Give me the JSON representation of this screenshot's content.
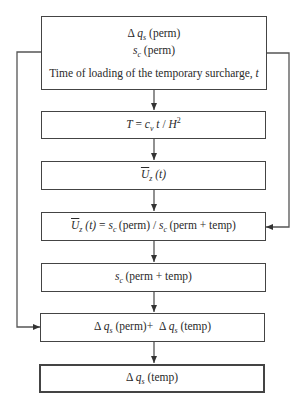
{
  "diagram": {
    "type": "flowchart",
    "nodes": [
      {
        "id": "input",
        "lines": [
          "Δ q_s (perm)",
          "s_c (perm)",
          "Time of loading of the temporary surcharge, t"
        ]
      },
      {
        "id": "time-factor",
        "lines": [
          "T = c_v t / H^2"
        ]
      },
      {
        "id": "avg-consolidation",
        "lines": [
          "U_z (t)"
        ]
      },
      {
        "id": "consolidation-ratio",
        "lines": [
          "U_z (t) = s_c(perm) / s_c(perm + temp)"
        ]
      },
      {
        "id": "total-settlement",
        "lines": [
          "s_c(perm + temp)"
        ]
      },
      {
        "id": "total-surcharge",
        "lines": [
          "Δ q_s (perm)+ Δ q_s (temp)"
        ]
      },
      {
        "id": "temp-surcharge",
        "lines": [
          "Δ q_s (temp)"
        ]
      }
    ],
    "edges": [
      {
        "from": "input",
        "to": "time-factor"
      },
      {
        "from": "time-factor",
        "to": "avg-consolidation"
      },
      {
        "from": "avg-consolidation",
        "to": "consolidation-ratio"
      },
      {
        "from": "input",
        "to": "consolidation-ratio",
        "route": "right-side"
      },
      {
        "from": "consolidation-ratio",
        "to": "total-settlement"
      },
      {
        "from": "total-settlement",
        "to": "total-surcharge"
      },
      {
        "from": "input",
        "to": "total-surcharge",
        "route": "left-side"
      },
      {
        "from": "total-surcharge",
        "to": "temp-surcharge"
      }
    ]
  },
  "labels": {
    "delta": "Δ",
    "q": "q",
    "s_sub": "s",
    "s": "s",
    "c_sub": "c",
    "perm": "(perm)",
    "temp": "(temp)",
    "perm_plus_temp": "(perm + temp)",
    "time_text": "Time of loading of the temporary surcharge,",
    "t": "t",
    "T": "T",
    "eq": "=",
    "c": "c",
    "v_sub": "v",
    "slash": "/",
    "H": "H",
    "two": "2",
    "U": "U",
    "z_sub": "z",
    "t_paren": "(t)",
    "plus": "+"
  },
  "colors": {
    "line": "#444444",
    "text": "#2a2a2a",
    "background": "#ffffff"
  }
}
